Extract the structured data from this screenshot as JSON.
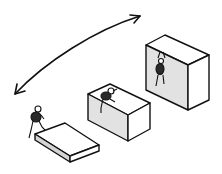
{
  "illustration": {
    "subject": "Three boxes of increasing height, each with a small figure climbing, and a double-headed curved arrow indicating progression",
    "colors": {
      "background": "#ffffff",
      "stroke": "#111111",
      "box_top": "#ffffff",
      "box_side_light": "#e6e6e6",
      "box_side_dark": "#d4d4d4",
      "figure_body": "#2a2a2a"
    },
    "boxes": [
      {
        "name": "low",
        "height_level": 1
      },
      {
        "name": "medium",
        "height_level": 2
      },
      {
        "name": "tall",
        "height_level": 3
      }
    ],
    "figures": [
      {
        "position": "stepping onto low box"
      },
      {
        "position": "climbing over top of medium box"
      },
      {
        "position": "hanging on front face of tall box"
      }
    ],
    "arrow": {
      "type": "double-headed curved"
    }
  }
}
